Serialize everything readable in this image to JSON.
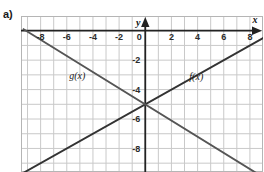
{
  "part_label": "a)",
  "chart_data": {
    "type": "line",
    "title": "",
    "xlabel": "x",
    "ylabel": "y",
    "xlim": [
      -9.5,
      9.0
    ],
    "ylim": [
      -9.6,
      1.0
    ],
    "grid": true,
    "grid_step": 1,
    "legend": "inline-labels",
    "xticks": [
      -8,
      -6,
      -4,
      -2,
      0,
      2,
      4,
      6,
      8
    ],
    "xtick_labels": [
      "-8",
      "-6",
      "-4",
      "-2",
      "0",
      "2",
      "4",
      "6",
      "8"
    ],
    "yticks": [
      -2,
      -4,
      -6,
      -8
    ],
    "ytick_labels": [
      "-2",
      "-4",
      "-6",
      "-8"
    ],
    "origin_label": "0",
    "series": [
      {
        "name": "f(x)",
        "label": "f(x)",
        "color": "#333333",
        "slope": 0.5,
        "intercept": -5,
        "points": [
          [
            -9.5,
            -9.75
          ],
          [
            9.0,
            -0.5
          ]
        ],
        "label_x": 3.9,
        "label_y": -3.35
      },
      {
        "name": "g(x)",
        "label": "g(x)",
        "color": "#555555",
        "slope": -0.55,
        "intercept": -5,
        "points": [
          [
            -9.3,
            0.1
          ],
          [
            8.6,
            -9.73
          ]
        ],
        "label_x": -5.2,
        "label_y": -3.25
      }
    ],
    "intersection": [
      0,
      -5
    ],
    "axis_colors": {
      "grid": "#c9c9c9",
      "axis": "#222222",
      "border": "#b5b5b5"
    }
  }
}
